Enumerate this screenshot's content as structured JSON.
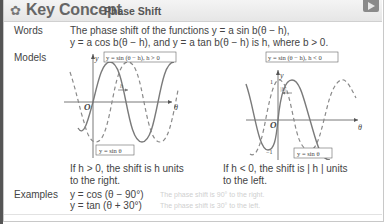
{
  "header": {
    "icon": "gear-icon",
    "title": "Key Concept",
    "subtitle": "Phase Shift",
    "play_icon": "play-icon"
  },
  "words": {
    "label": "Words",
    "line1": "The phase shift of the functions y = a sin b(θ − h),",
    "line2": "y = a cos b(θ − h), and y = a tan b(θ − h) is h, where b > 0."
  },
  "models": {
    "label": "Models",
    "left_graph": {
      "shifted_label": "y = sin (θ − h), h > 0",
      "base_label": "y = sin θ",
      "shift_label": "h",
      "axis_y": "y",
      "axis_x": "θ",
      "origin": "O",
      "caption_line1": "If h > 0, the shift is h units",
      "caption_line2": "to the right."
    },
    "right_graph": {
      "shifted_label": "y = sin (θ − h), h < 0",
      "base_label": "y = sin θ",
      "shift_label": "|h|",
      "axis_y": "y",
      "axis_x": "θ",
      "origin": "O",
      "tick_top": "1",
      "tick_bottom": "−1",
      "caption_line1": "If h < 0, the shift is | h | units",
      "caption_line2": "to the left."
    }
  },
  "examples": {
    "label": "Examples",
    "items": [
      {
        "equation": "y = cos (θ − 90°)",
        "note": "The phase shift is 90° to the right."
      },
      {
        "equation": "y = tan (θ + 30°)",
        "note": "The phase shift is 30° to the left."
      }
    ]
  },
  "colors": {
    "curve": "#7a7a7a",
    "axis": "#555555",
    "header_bg": "#ececec"
  }
}
